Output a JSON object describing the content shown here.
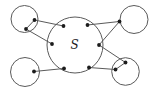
{
  "diagram": {
    "type": "set-diagram",
    "label": "S",
    "colors": {
      "background": "#ffffff",
      "line": "#5a5a5a",
      "dot": "#1c1c1c"
    },
    "canvas": {
      "width": 150,
      "height": 94
    },
    "central_circle": {
      "id": "central-set",
      "cx": 75,
      "cy": 45,
      "r": 28
    },
    "satellite_circles": [
      {
        "id": "top-left",
        "cx": 24.5,
        "cy": 19,
        "r": 13.5
      },
      {
        "id": "top-right",
        "cx": 134,
        "cy": 19.5,
        "r": 14
      },
      {
        "id": "bottom-left",
        "cx": 25,
        "cy": 72,
        "r": 14.5
      },
      {
        "id": "bottom-right",
        "cx": 125.5,
        "cy": 71.5,
        "r": 13.8
      }
    ],
    "dot_radius": 1.9,
    "points": {
      "inner-top-left": [
        63.5,
        26
      ],
      "inner-top-right": [
        87.5,
        25
      ],
      "inner-left": [
        52,
        44
      ],
      "inner-right": [
        99,
        45
      ],
      "inner-bottom-left": [
        64,
        68.5
      ],
      "inner-bottom-right": [
        89,
        67.5
      ],
      "outer-tl-a": [
        34.5,
        20
      ],
      "outer-tl-b": [
        26,
        29
      ],
      "outer-tr": [
        119.5,
        21.5
      ],
      "outer-bl": [
        34,
        71.5
      ],
      "outer-br-a": [
        125.5,
        62.5
      ],
      "outer-br-b": [
        115.5,
        69.5
      ]
    },
    "edges": [
      [
        "outer-tl-a",
        "outer-tl-b"
      ],
      [
        "outer-tl-a",
        "inner-top-left"
      ],
      [
        "outer-tl-b",
        "inner-left"
      ],
      [
        "outer-tr",
        "inner-top-right"
      ],
      [
        "outer-tr",
        "inner-right"
      ],
      [
        "outer-bl",
        "inner-bottom-left"
      ],
      [
        "outer-br-a",
        "outer-br-b"
      ],
      [
        "outer-br-a",
        "inner-right"
      ],
      [
        "outer-br-b",
        "inner-bottom-right"
      ]
    ]
  }
}
